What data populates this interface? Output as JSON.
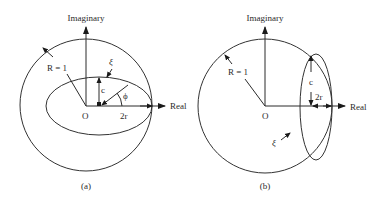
{
  "figure": {
    "panels": [
      {
        "id": "a",
        "caption": "(a)",
        "axis_labels": {
          "vertical": "Imaginary",
          "horizontal": "Real"
        },
        "labels": {
          "radius": "R = 1",
          "xi": "ξ",
          "c": "c",
          "phi": "ϕ",
          "origin": "O",
          "two_r": "2r"
        }
      },
      {
        "id": "b",
        "caption": "(b)",
        "axis_labels": {
          "vertical": "Imaginary",
          "horizontal": "Real"
        },
        "labels": {
          "radius": "R = 1",
          "xi": "ξ",
          "c": "c",
          "origin": "O",
          "two_r": "2r"
        }
      }
    ]
  }
}
